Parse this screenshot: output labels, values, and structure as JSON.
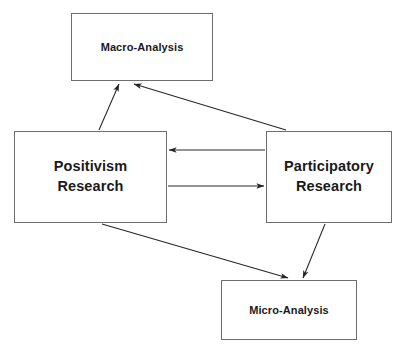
{
  "diagram": {
    "type": "flow-diagram",
    "background_color": "#ffffff",
    "box_border_color": "#6d6d6d",
    "arrow_color": "#262626",
    "text_color": "#1a1a1a",
    "nodes": [
      {
        "id": "macro",
        "label": "Macro-Analysis",
        "x": 71,
        "y": 13,
        "width": 142,
        "height": 68,
        "font_size": 11
      },
      {
        "id": "positivism",
        "label": "Positivism\nResearch",
        "x": 14,
        "y": 131,
        "width": 153,
        "height": 92,
        "font_size": 14.5
      },
      {
        "id": "participatory",
        "label": "Participatory\nResearch",
        "x": 266,
        "y": 131,
        "width": 126,
        "height": 92,
        "font_size": 14.5
      },
      {
        "id": "micro",
        "label": "Micro-Analysis",
        "x": 221,
        "y": 280,
        "width": 136,
        "height": 60,
        "font_size": 11
      }
    ],
    "edges": [
      {
        "id": "positivism-to-macro",
        "from": "positivism",
        "to": "macro",
        "direction": "up-right",
        "x1": 99,
        "y1": 130,
        "x2": 119,
        "y2": 84
      },
      {
        "id": "participatory-to-macro",
        "from": "participatory",
        "to": "macro",
        "direction": "up-left",
        "x1": 286,
        "y1": 130,
        "x2": 134,
        "y2": 84
      },
      {
        "id": "participatory-to-positivism",
        "from": "participatory",
        "to": "positivism",
        "direction": "left",
        "x1": 265,
        "y1": 150,
        "x2": 169,
        "y2": 150
      },
      {
        "id": "positivism-to-participatory",
        "from": "positivism",
        "to": "participatory",
        "direction": "right",
        "x1": 168,
        "y1": 186,
        "x2": 264,
        "y2": 186
      },
      {
        "id": "positivism-to-micro",
        "from": "positivism",
        "to": "micro",
        "direction": "down-right",
        "x1": 102,
        "y1": 224,
        "x2": 288,
        "y2": 278
      },
      {
        "id": "participatory-to-micro",
        "from": "participatory",
        "to": "micro",
        "direction": "down-left",
        "x1": 325,
        "y1": 224,
        "x2": 303,
        "y2": 278
      }
    ]
  }
}
